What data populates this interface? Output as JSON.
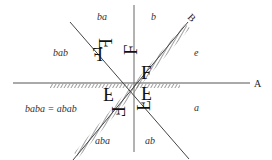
{
  "diagram": {
    "axes": {
      "A": "A",
      "B": "B"
    },
    "regions": {
      "e": "e",
      "a": "a",
      "b": "b",
      "ab": "ab",
      "ba": "ba",
      "aba": "aba",
      "bab": "bab",
      "baba": "baba = abab"
    },
    "glyph": "F",
    "colors": {
      "line": "#555555",
      "text": "#333333",
      "glyph": "#111111"
    }
  }
}
